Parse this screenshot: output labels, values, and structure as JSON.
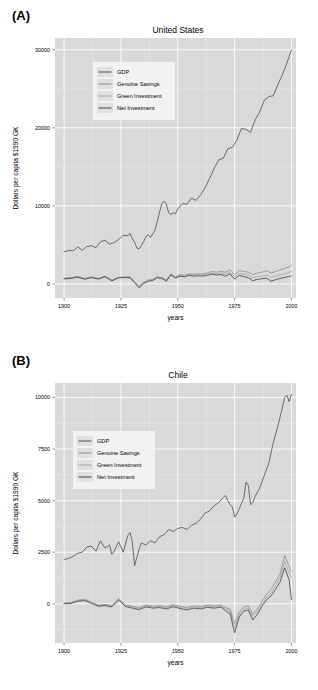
{
  "figure": {
    "background": "#ffffff",
    "panel_fill": "#d9d9d9",
    "grid_major": "#ffffff",
    "grid_minor": "#ebebeb",
    "text_color": "#000000"
  },
  "chart_data": [
    {
      "id": "panel-a",
      "type": "line",
      "panel_label": "(A)",
      "title": "United States",
      "xlabel": "years",
      "ylabel": "Dollars per capita $1990 GK",
      "xlim": [
        1896,
        2002
      ],
      "ylim": [
        -1800,
        31500
      ],
      "xticks": [
        1900,
        1925,
        1950,
        1975,
        2000
      ],
      "xticklabels": [
        "1900",
        "1925",
        "1950",
        "1975",
        "2000"
      ],
      "yticks": [
        0,
        10000,
        20000,
        30000
      ],
      "yticklabels": [
        "0",
        "10000",
        "20000",
        "30000"
      ],
      "grid": true,
      "legend_position": "top-left",
      "legend": [
        "GDP",
        "Genuine Savings",
        "Green Investment",
        "Net Investment"
      ],
      "series": [
        {
          "name": "GDP",
          "color": "#4d4d4d",
          "x": [
            1900,
            1902,
            1904,
            1906,
            1908,
            1910,
            1912,
            1914,
            1916,
            1918,
            1920,
            1922,
            1924,
            1926,
            1928,
            1929,
            1930,
            1931,
            1932,
            1933,
            1934,
            1935,
            1936,
            1937,
            1938,
            1939,
            1940,
            1941,
            1942,
            1943,
            1944,
            1945,
            1946,
            1947,
            1948,
            1949,
            1950,
            1952,
            1954,
            1956,
            1958,
            1960,
            1962,
            1964,
            1966,
            1968,
            1970,
            1972,
            1974,
            1976,
            1978,
            1980,
            1982,
            1984,
            1986,
            1988,
            1990,
            1992,
            1994,
            1996,
            1998,
            2000
          ],
          "y": [
            4100,
            4300,
            4250,
            4750,
            4300,
            4800,
            4900,
            4650,
            5400,
            5600,
            5100,
            5300,
            5700,
            6200,
            6200,
            6450,
            5800,
            5350,
            4600,
            4500,
            4950,
            5400,
            6100,
            6300,
            5950,
            6400,
            6900,
            8000,
            9200,
            10300,
            10600,
            10200,
            9100,
            8900,
            9100,
            9000,
            9600,
            10300,
            10200,
            11000,
            10700,
            11400,
            12300,
            13500,
            14800,
            15900,
            16100,
            17300,
            17500,
            18400,
            19900,
            19800,
            19400,
            21000,
            22000,
            23500,
            24000,
            24100,
            25500,
            26800,
            28300,
            30000
          ]
        },
        {
          "name": "Genuine Savings",
          "color": "#8c8c8c",
          "x": [
            1900,
            1903,
            1906,
            1909,
            1912,
            1915,
            1918,
            1921,
            1924,
            1927,
            1929,
            1931,
            1933,
            1935,
            1937,
            1939,
            1941,
            1943,
            1945,
            1947,
            1949,
            1951,
            1953,
            1955,
            1957,
            1959,
            1961,
            1963,
            1965,
            1967,
            1969,
            1971,
            1973,
            1975,
            1977,
            1979,
            1981,
            1983,
            1985,
            1987,
            1989,
            1991,
            1993,
            1995,
            1997,
            1999,
            2000
          ],
          "y": [
            750,
            800,
            950,
            700,
            900,
            700,
            1000,
            500,
            850,
            900,
            900,
            300,
            -250,
            200,
            500,
            600,
            900,
            800,
            500,
            1300,
            900,
            1200,
            1100,
            1300,
            1250,
            1300,
            1300,
            1400,
            1600,
            1500,
            1600,
            1500,
            1800,
            1200,
            1700,
            1600,
            1500,
            1200,
            1400,
            1500,
            1700,
            1400,
            1600,
            1800,
            2000,
            2200,
            2400
          ]
        },
        {
          "name": "Green Investment",
          "color": "#a6a6a6",
          "x": [
            1900,
            1903,
            1906,
            1909,
            1912,
            1915,
            1918,
            1921,
            1924,
            1927,
            1929,
            1931,
            1933,
            1935,
            1937,
            1939,
            1941,
            1943,
            1945,
            1947,
            1949,
            1951,
            1953,
            1955,
            1957,
            1959,
            1961,
            1963,
            1965,
            1967,
            1969,
            1971,
            1973,
            1975,
            1977,
            1979,
            1981,
            1983,
            1985,
            1987,
            1989,
            1991,
            1993,
            1995,
            1997,
            1999,
            2000
          ],
          "y": [
            700,
            760,
            900,
            650,
            850,
            650,
            950,
            450,
            800,
            850,
            850,
            250,
            -300,
            150,
            450,
            550,
            850,
            750,
            450,
            1200,
            850,
            1100,
            1000,
            1200,
            1150,
            1200,
            1150,
            1250,
            1400,
            1300,
            1400,
            1250,
            1500,
            900,
            1350,
            1250,
            1100,
            800,
            950,
            1000,
            1150,
            850,
            1000,
            1150,
            1300,
            1450,
            1600
          ]
        },
        {
          "name": "Net Investment",
          "color": "#404040",
          "x": [
            1900,
            1903,
            1906,
            1909,
            1912,
            1915,
            1918,
            1921,
            1924,
            1927,
            1929,
            1931,
            1933,
            1935,
            1937,
            1939,
            1941,
            1943,
            1945,
            1947,
            1949,
            1951,
            1953,
            1955,
            1957,
            1959,
            1961,
            1963,
            1965,
            1967,
            1969,
            1971,
            1973,
            1975,
            1977,
            1979,
            1981,
            1983,
            1985,
            1987,
            1989,
            1991,
            1993,
            1995,
            1997,
            1999,
            2000
          ],
          "y": [
            650,
            700,
            880,
            600,
            820,
            620,
            920,
            400,
            780,
            820,
            800,
            150,
            -500,
            50,
            350,
            450,
            800,
            700,
            350,
            1150,
            750,
            1000,
            900,
            1100,
            1000,
            1050,
            1000,
            1100,
            1250,
            1150,
            1200,
            1000,
            1300,
            600,
            1100,
            950,
            800,
            400,
            600,
            650,
            750,
            350,
            550,
            700,
            850,
            950,
            1050
          ]
        }
      ]
    },
    {
      "id": "panel-b",
      "type": "line",
      "panel_label": "(B)",
      "title": "Chile",
      "xlabel": "years",
      "ylabel": "Dollars per capita $1990 GK",
      "xlim": [
        1896,
        2002
      ],
      "ylim": [
        -1900,
        10700
      ],
      "xticks": [
        1900,
        1925,
        1950,
        1975,
        2000
      ],
      "xticklabels": [
        "1900",
        "1925",
        "1950",
        "1975",
        "2000"
      ],
      "yticks": [
        0,
        2500,
        5000,
        7500,
        10000
      ],
      "yticklabels": [
        "0",
        "2500",
        "5000",
        "7500",
        "10000"
      ],
      "grid": true,
      "legend_position": "top-left",
      "legend": [
        "GDP",
        "Genuine Savings",
        "Green Investment",
        "Net Investment"
      ],
      "series": [
        {
          "name": "GDP",
          "color": "#4d4d4d",
          "x": [
            1900,
            1902,
            1904,
            1906,
            1908,
            1910,
            1912,
            1914,
            1916,
            1918,
            1920,
            1921,
            1922,
            1924,
            1926,
            1928,
            1929,
            1930,
            1931,
            1932,
            1933,
            1934,
            1936,
            1938,
            1940,
            1942,
            1944,
            1946,
            1948,
            1950,
            1952,
            1954,
            1956,
            1958,
            1960,
            1962,
            1964,
            1966,
            1968,
            1970,
            1971,
            1972,
            1973,
            1974,
            1975,
            1976,
            1977,
            1978,
            1979,
            1980,
            1981,
            1982,
            1983,
            1984,
            1986,
            1988,
            1990,
            1992,
            1994,
            1996,
            1997,
            1998,
            1999,
            2000
          ],
          "y": [
            2150,
            2200,
            2300,
            2450,
            2500,
            2750,
            2800,
            2550,
            3050,
            2700,
            2850,
            2400,
            2550,
            3000,
            2500,
            3300,
            3450,
            3000,
            1850,
            2250,
            2650,
            2950,
            2850,
            3050,
            2950,
            3250,
            3350,
            3600,
            3500,
            3650,
            3700,
            3600,
            3800,
            3900,
            4100,
            4400,
            4500,
            4750,
            4900,
            5150,
            5250,
            5000,
            4800,
            4700,
            4200,
            4350,
            4600,
            4850,
            5100,
            5900,
            5750,
            4800,
            4900,
            5200,
            5600,
            6200,
            6800,
            7800,
            8600,
            9500,
            10000,
            10100,
            9800,
            10150
          ]
        },
        {
          "name": "Genuine Savings",
          "color": "#8c8c8c",
          "x": [
            1900,
            1903,
            1906,
            1909,
            1912,
            1915,
            1918,
            1921,
            1924,
            1927,
            1930,
            1933,
            1936,
            1939,
            1942,
            1945,
            1948,
            1951,
            1954,
            1957,
            1960,
            1963,
            1966,
            1969,
            1971,
            1973,
            1975,
            1977,
            1979,
            1981,
            1983,
            1985,
            1987,
            1989,
            1991,
            1993,
            1995,
            1997,
            1999,
            2000
          ],
          "y": [
            30,
            60,
            180,
            220,
            80,
            -60,
            -30,
            -80,
            250,
            -50,
            -120,
            -180,
            -60,
            -120,
            -90,
            -150,
            -40,
            -120,
            -180,
            -100,
            -140,
            -60,
            -100,
            -60,
            -180,
            -250,
            -950,
            -400,
            -150,
            -100,
            -500,
            -250,
            100,
            450,
            700,
            1050,
            1450,
            2350,
            1800,
            1550
          ]
        },
        {
          "name": "Green Investment",
          "color": "#a6a6a6",
          "x": [
            1900,
            1903,
            1906,
            1909,
            1912,
            1915,
            1918,
            1921,
            1924,
            1927,
            1930,
            1933,
            1936,
            1939,
            1942,
            1945,
            1948,
            1951,
            1954,
            1957,
            1960,
            1963,
            1966,
            1969,
            1971,
            1973,
            1975,
            1977,
            1979,
            1981,
            1983,
            1985,
            1987,
            1989,
            1991,
            1993,
            1995,
            1997,
            1999,
            2000
          ],
          "y": [
            10,
            40,
            150,
            190,
            50,
            -90,
            -60,
            -110,
            210,
            -90,
            -160,
            -220,
            -100,
            -160,
            -130,
            -190,
            -90,
            -170,
            -230,
            -150,
            -190,
            -110,
            -150,
            -110,
            -250,
            -350,
            -1150,
            -520,
            -250,
            -200,
            -620,
            -380,
            -20,
            300,
            520,
            880,
            1250,
            2050,
            1500,
            1250
          ]
        },
        {
          "name": "Net Investment",
          "color": "#404040",
          "x": [
            1900,
            1903,
            1906,
            1909,
            1912,
            1915,
            1918,
            1921,
            1924,
            1927,
            1930,
            1933,
            1936,
            1939,
            1942,
            1945,
            1948,
            1951,
            1954,
            1957,
            1960,
            1963,
            1966,
            1969,
            1971,
            1973,
            1975,
            1977,
            1979,
            1981,
            1983,
            1985,
            1987,
            1989,
            1991,
            1993,
            1995,
            1997,
            1999,
            2000
          ],
          "y": [
            0,
            20,
            120,
            160,
            20,
            -120,
            -90,
            -150,
            180,
            -130,
            -210,
            -280,
            -150,
            -210,
            -180,
            -250,
            -140,
            -230,
            -300,
            -210,
            -250,
            -170,
            -210,
            -160,
            -330,
            -480,
            -1400,
            -650,
            -350,
            -300,
            -780,
            -520,
            -120,
            180,
            380,
            700,
            1050,
            1750,
            1150,
            200
          ]
        }
      ]
    }
  ]
}
